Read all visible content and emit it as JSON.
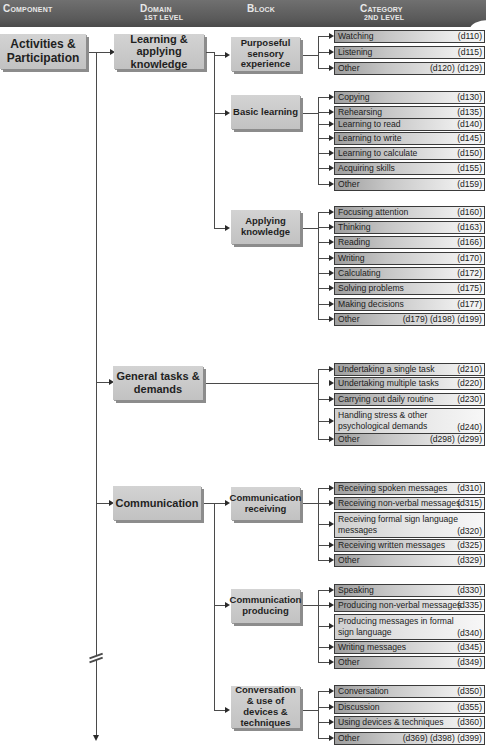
{
  "header": {
    "component": "Component",
    "domain": "Domain",
    "domain_sub": "1st level",
    "block": "Block",
    "category": "Category",
    "category_sub": "2nd level"
  },
  "component": {
    "label": "Activities & Participation"
  },
  "domains": [
    {
      "label": "Learning & applying knowledge",
      "blocks": [
        {
          "label": "Purposeful sensory experience",
          "categories": [
            {
              "label": "Watching",
              "code": "(d110)"
            },
            {
              "label": "Listening",
              "code": "(d115)"
            },
            {
              "label": "Other",
              "code": "(d120) (d129)"
            }
          ]
        },
        {
          "label": "Basic learning",
          "categories": [
            {
              "label": "Copying",
              "code": "(d130)"
            },
            {
              "label": "Rehearsing",
              "code": "(d135)"
            },
            {
              "label": "Learning to read",
              "code": "(d140)"
            },
            {
              "label": "Learning to write",
              "code": "(d145)"
            },
            {
              "label": "Learning to calculate",
              "code": "(d150)"
            },
            {
              "label": "Acquiring skills",
              "code": "(d155)"
            },
            {
              "label": "Other",
              "code": "(d159)"
            }
          ]
        },
        {
          "label": "Applying knowledge",
          "categories": [
            {
              "label": "Focusing attention",
              "code": "(d160)"
            },
            {
              "label": "Thinking",
              "code": "(d163)"
            },
            {
              "label": "Reading",
              "code": "(d166)"
            },
            {
              "label": "Writing",
              "code": "(d170)"
            },
            {
              "label": "Calculating",
              "code": "(d172)"
            },
            {
              "label": "Solving problems",
              "code": "(d175)"
            },
            {
              "label": "Making decisions",
              "code": "(d177)"
            },
            {
              "label": "Other",
              "code": "(d179) (d198) (d199)"
            }
          ]
        }
      ]
    },
    {
      "label": "General tasks & demands",
      "categories": [
        {
          "label": "Undertaking a single task",
          "code": "(d210)"
        },
        {
          "label": "Undertaking multiple tasks",
          "code": "(d220)"
        },
        {
          "label": "Carrying out daily routine",
          "code": "(d230)"
        },
        {
          "label": "Handling stress & other\npsychological demands",
          "code": "(d240)"
        },
        {
          "label": "Other",
          "code": "(d298) (d299)"
        }
      ]
    },
    {
      "label": "Communication",
      "blocks": [
        {
          "label": "Communication receiving",
          "categories": [
            {
              "label": "Receiving spoken messages",
              "code": "(d310)"
            },
            {
              "label": "Receiving non-verbal messages",
              "code": "(d315)"
            },
            {
              "label": "Receiving formal sign language\nmessages",
              "code": "(d320)"
            },
            {
              "label": "Receiving written messages",
              "code": "(d325)"
            },
            {
              "label": "Other",
              "code": "(d329)"
            }
          ]
        },
        {
          "label": "Communication producing",
          "categories": [
            {
              "label": "Speaking",
              "code": "(d330)"
            },
            {
              "label": "Producing non-verbal messages",
              "code": "(d335)"
            },
            {
              "label": "Producing messages in formal\nsign language",
              "code": "(d340)"
            },
            {
              "label": "Writing messages",
              "code": "(d345)"
            },
            {
              "label": "Other",
              "code": "(d349)"
            }
          ]
        },
        {
          "label": "Conversation & use of devices & techniques",
          "categories": [
            {
              "label": "Conversation",
              "code": "(d350)"
            },
            {
              "label": "Discussion",
              "code": "(d355)"
            },
            {
              "label": "Using devices & techniques",
              "code": "(d360)"
            },
            {
              "label": "Other",
              "code": "(d369) (d398) (d399)"
            }
          ]
        }
      ]
    }
  ],
  "icons": {
    "connector_arrow": "arrow-right",
    "continuation_arrow": "arrow-down",
    "break_mark": "double-slash"
  }
}
